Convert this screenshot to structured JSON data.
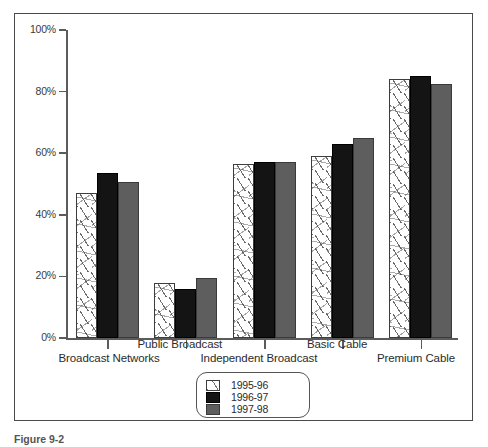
{
  "figure": {
    "caption": "Figure 9-2",
    "frame_color": "#4a4a4a"
  },
  "chart_data": {
    "type": "bar",
    "title": "",
    "subtitle": "",
    "xlabel": "",
    "ylabel": "",
    "ylim": [
      0,
      100
    ],
    "grid": false,
    "legend_position": "bottom-center",
    "categories": [
      "Broadcast Networks",
      "Public Broadcast",
      "Independent Broadcast",
      "Basic Cable",
      "Premium Cable"
    ],
    "ytick_labels": [
      "0%",
      "20%",
      "40%",
      "60%",
      "80%",
      "100%"
    ],
    "ytick_values": [
      0,
      20,
      40,
      60,
      80,
      100
    ],
    "series": [
      {
        "name": "1995-96",
        "color": "#ffffff",
        "pattern": "speckled",
        "values": [
          47,
          18,
          56.5,
          59,
          84
        ]
      },
      {
        "name": "1996-97",
        "color": "#141414",
        "pattern": "solid",
        "values": [
          53.5,
          16,
          57,
          63,
          85
        ]
      },
      {
        "name": "1997-98",
        "color": "#5e5e5e",
        "pattern": "solid",
        "values": [
          50.5,
          19.5,
          57,
          65,
          82.5
        ]
      }
    ]
  },
  "legend": {
    "entries": [
      "1995-96",
      "1996-97",
      "1997-98"
    ]
  },
  "colors": {
    "series_1": "#ffffff",
    "series_2": "#141414",
    "series_3": "#5e5e5e",
    "axis": "#5b5b5b",
    "text": "#2b2b2b"
  }
}
